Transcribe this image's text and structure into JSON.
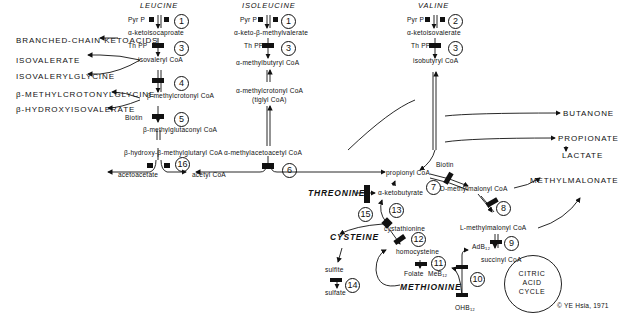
{
  "amino_acids": {
    "leucine": "LEUCINE",
    "isoleucine": "ISOLEUCINE",
    "valine": "VALINE",
    "threonine": "THREONINE",
    "cysteine": "CYSTEINE",
    "methionine": "METHIONINE"
  },
  "leucine_path": {
    "cofactor1": "Pyr P",
    "intermediate1": "α-ketoisocaproate",
    "cofactor2": "Th PP",
    "intermediate2": "isovaleryl CoA",
    "intermediate3": "β-methylcrotonyl CoA",
    "cofactor3": "Biotin",
    "intermediate4": "β-methylglutaconyl CoA",
    "intermediate5": "β-hydroxy-β-methylglutaryl CoA",
    "product1": "acetoacetate",
    "product2": "acetyl CoA"
  },
  "isoleucine_path": {
    "cofactor1": "Pyr P",
    "intermediate1": "α-keto-β-methylvalerate",
    "cofactor2": "Th PP",
    "intermediate2": "α-methylbutyryl CoA",
    "intermediate3": "α-methylcrotonyl CoA",
    "intermediate3b": "(tiglyl CoA)",
    "intermediate4": "α-methylacetoacetyl CoA"
  },
  "valine_path": {
    "cofactor1": "Pyr P",
    "intermediate1": "α-ketoisovalerate",
    "cofactor2": "Th PP",
    "intermediate2": "isobutyryl CoA"
  },
  "side_products": {
    "branched_chain": "BRANCHED-CHAIN KETOACIDS",
    "isovalerate": "ISOVALERATE",
    "isovalerylglycine": "ISOVALERYLGLYCINE",
    "methylcrotonylglycine": "β-METHYLCROTONYLGLYCINE",
    "hydroxyisovalerate": "β-HYDROXYISOVALERATE",
    "butanone": "BUTANONE",
    "propionate": "PROPIONATE",
    "lactate": "LACTATE",
    "methylmalonate": "METHYLMALONATE"
  },
  "lower_path": {
    "propionyl": "propionyl CoA",
    "biotin": "Biotin",
    "d_methylmalonyl": "D-methylmalonyl CoA",
    "l_methylmalonyl": "L-methylmalonyl CoA",
    "adb12": "AdB₁₂",
    "succinyl": "succinyl CoA",
    "ketobutyrate": "α-ketobutyrate",
    "cystathionine": "cystathionine",
    "homocysteine": "homocysteine",
    "folate": "Folate",
    "meb12": "MeB₁₂",
    "ohb12": "OHB₁₂",
    "sulfite": "sulfite",
    "sulfate": "sulfate",
    "citric_cycle": "CITRIC\nACID\nCYCLE"
  },
  "steps": [
    "1",
    "1",
    "2",
    "3",
    "3",
    "3",
    "4",
    "5",
    "16",
    "6",
    "7",
    "8",
    "9",
    "10",
    "11",
    "12",
    "13",
    "14",
    "15"
  ],
  "copyright": "© YE Hsia, 1971"
}
